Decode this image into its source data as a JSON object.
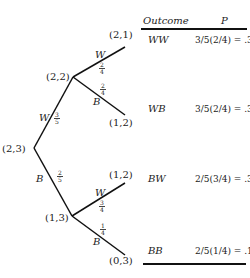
{
  "header": {
    "outcome": "Outcome",
    "p": "P"
  },
  "nodes": {
    "root": "(2,3)",
    "w": "(2,2)",
    "b": "(1,3)",
    "ww": "(2,1)",
    "wb": "(1,2)",
    "bw": "(1,2)",
    "bb": "(0,3)"
  },
  "branches": {
    "root_w": {
      "label": "W",
      "num": "3",
      "den": "5"
    },
    "root_b": {
      "label": "B",
      "num": "2",
      "den": "5"
    },
    "w_w": {
      "label": "W",
      "num": "2",
      "den": "4"
    },
    "w_b": {
      "label": "B",
      "num": "2",
      "den": "4"
    },
    "b_w": {
      "label": "W",
      "num": "3",
      "den": "4"
    },
    "b_b": {
      "label": "B",
      "num": "1",
      "den": "4"
    }
  },
  "rows": [
    {
      "outcome": "WW",
      "expr": "3/5(2/4) = .3"
    },
    {
      "outcome": "WB",
      "expr": "3/5(2/4) = .3"
    },
    {
      "outcome": "BW",
      "expr": "2/5(3/4) = .3"
    },
    {
      "outcome": "BB",
      "expr": "2/5(1/4) = .1"
    }
  ]
}
